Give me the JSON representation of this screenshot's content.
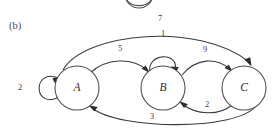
{
  "figure": {
    "panel_label": "(b)",
    "type": "state-transition-diagram",
    "background": "#ffffff",
    "stroke_color": "#3a3a3a",
    "text_color": "#2b2b2b"
  },
  "nodes": [
    {
      "id": "A",
      "label": "A",
      "cx": 77,
      "cy": 88,
      "r": 22
    },
    {
      "id": "B",
      "label": "B",
      "cx": 163,
      "cy": 88,
      "r": 22
    },
    {
      "id": "C",
      "label": "C",
      "cx": 244,
      "cy": 88,
      "r": 22
    }
  ],
  "edges": [
    {
      "id": "a-self",
      "from": "A",
      "to": "A",
      "weight": "2",
      "label_x": 20,
      "label_y": 88,
      "kind": "self-loop-left"
    },
    {
      "id": "a-to-b",
      "from": "A",
      "to": "B",
      "weight": "5",
      "label_x": 120,
      "label_y": 49,
      "kind": "arc-above"
    },
    {
      "id": "b-self",
      "from": "B",
      "to": "B",
      "weight": "1",
      "label_x": 163,
      "label_y": 34,
      "kind": "self-loop-top"
    },
    {
      "id": "b-to-c",
      "from": "B",
      "to": "C",
      "weight": "9",
      "label_x": 205,
      "label_y": 50,
      "kind": "arc-above"
    },
    {
      "id": "a-to-c",
      "from": "A",
      "to": "C",
      "weight": "7",
      "label_x": 160,
      "label_y": 19,
      "kind": "long-arc-top"
    },
    {
      "id": "c-to-b",
      "from": "C",
      "to": "B",
      "weight": "2",
      "label_x": 207,
      "label_y": 105,
      "kind": "arc-below"
    },
    {
      "id": "c-to-a",
      "from": "C",
      "to": "A",
      "weight": "3",
      "label_x": 152,
      "label_y": 117,
      "kind": "long-arc-bottom"
    }
  ],
  "partial_shape": {
    "id": "cropped-circle-above",
    "description": "bottom edge of a circle cropped by the top image boundary",
    "cx": 139,
    "cy": -8,
    "r": 14
  }
}
